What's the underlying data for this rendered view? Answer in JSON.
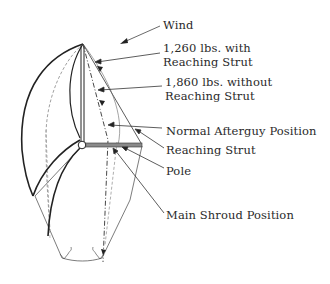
{
  "diagram": {
    "labels": {
      "wind": "Wind",
      "load_with_strut_line1": "1,260 lbs. with",
      "load_with_strut_line2": "Reaching Strut",
      "load_without_strut_line1": "1,860 lbs. without",
      "load_without_strut_line2": "Reaching Strut",
      "normal_afterguy": "Normal Afterguy Position",
      "reaching_strut": "Reaching Strut",
      "pole": "Pole",
      "main_shroud": "Main Shroud Position"
    },
    "loads": [
      {
        "condition": "with Reaching Strut",
        "value": 1260,
        "unit": "lbs."
      },
      {
        "condition": "without Reaching Strut",
        "value": 1860,
        "unit": "lbs."
      }
    ],
    "colors": {
      "line": "#2a2a2a",
      "dashed": "#555555",
      "pole_fill": "#8a8a8a",
      "background": "#ffffff"
    }
  }
}
